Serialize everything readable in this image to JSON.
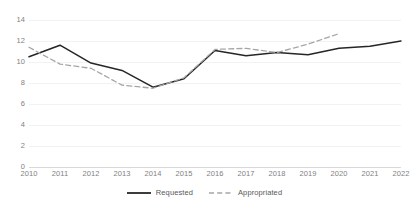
{
  "chart_data": {
    "type": "line",
    "title": "",
    "subtitle": "",
    "xlabel": "",
    "ylabel": "",
    "categories": [
      "2010",
      "2011",
      "2012",
      "2013",
      "2014",
      "2015",
      "2016",
      "2017",
      "2018",
      "2019",
      "2020",
      "2021",
      "2022"
    ],
    "ylim": [
      0,
      14
    ],
    "yticks": [
      "0",
      "2",
      "4",
      "6",
      "8",
      "10",
      "12",
      "14"
    ],
    "ytick_values": [
      0,
      2,
      4,
      6,
      8,
      10,
      12,
      14
    ],
    "grid": true,
    "grid_axis": "y",
    "legend_position": "bottom",
    "series": [
      {
        "name": "Requested",
        "style": "solid",
        "color": "#262626",
        "values": [
          10.5,
          11.6,
          9.9,
          9.2,
          7.6,
          8.4,
          11.1,
          10.6,
          10.9,
          10.7,
          11.3,
          11.5,
          12.0
        ]
      },
      {
        "name": "Appropriated",
        "style": "dashed",
        "color": "#a6a6a6",
        "values": [
          11.4,
          9.8,
          9.4,
          7.8,
          7.5,
          8.5,
          11.2,
          11.3,
          10.9,
          11.7,
          12.7,
          null,
          null
        ]
      }
    ]
  },
  "legend": {
    "items": [
      {
        "label": "Requested",
        "style": "solid",
        "color": "#262626"
      },
      {
        "label": "Appropriated",
        "style": "dashed",
        "color": "#a6a6a6"
      }
    ]
  },
  "colors": {
    "requested": "#262626",
    "appropriated": "#a6a6a6",
    "gridline": "#f2f2f2",
    "axis": "#d9d9d9",
    "tick_text": "#7f7f7f",
    "legend_text": "#595959",
    "background": "#ffffff"
  }
}
